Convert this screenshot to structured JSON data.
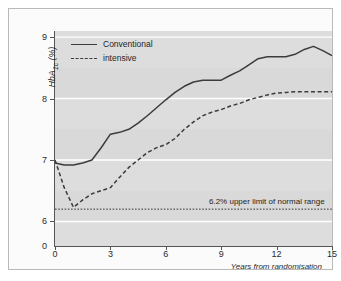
{
  "chart_data": {
    "type": "line",
    "title": "",
    "xlabel": "Years from randomisation",
    "ylabel": "HbA1c (%)",
    "ylabel_html": "HbA<sub>1c</sub> (%)",
    "xlim": [
      0,
      15
    ],
    "ylim": [
      5.6,
      9.1
    ],
    "yticks": [
      6,
      7,
      8,
      9
    ],
    "ytick_labels": [
      "6",
      "7",
      "8",
      "9"
    ],
    "y_origin_label": "0",
    "y_axis_broken": true,
    "xticks": [
      0,
      3,
      6,
      9,
      12,
      15
    ],
    "xtick_labels": [
      "0",
      "3",
      "6",
      "9",
      "12",
      "15"
    ],
    "grid": "horizontal-white",
    "legend_position": "top-left",
    "plot_background": "#d9d9d9",
    "line_color": "#3c3c3c",
    "series": [
      {
        "name": "Conventional",
        "style": "solid",
        "x": [
          0,
          0.5,
          1,
          1.5,
          2,
          2.5,
          3,
          3.5,
          4,
          4.5,
          5,
          5.5,
          6,
          6.5,
          7,
          7.5,
          8,
          8.5,
          9,
          9.5,
          10,
          10.5,
          11,
          11.5,
          12,
          12.5,
          13,
          13.5,
          14,
          14.5,
          15
        ],
        "y": [
          6.95,
          6.92,
          6.92,
          6.95,
          7.0,
          7.2,
          7.42,
          7.45,
          7.5,
          7.6,
          7.72,
          7.85,
          7.98,
          8.1,
          8.2,
          8.27,
          8.3,
          8.3,
          8.3,
          8.38,
          8.45,
          8.55,
          8.65,
          8.68,
          8.68,
          8.68,
          8.72,
          8.8,
          8.85,
          8.78,
          8.7
        ]
      },
      {
        "name": "intensive",
        "style": "dashed",
        "x": [
          0,
          0.5,
          1,
          1.5,
          2,
          2.5,
          3,
          3.5,
          4,
          4.5,
          5,
          5.5,
          6,
          6.5,
          7,
          7.5,
          8,
          8.5,
          9,
          9.5,
          10,
          10.5,
          11,
          11.5,
          12,
          12.5,
          13,
          13.5,
          14,
          14.5,
          15
        ],
        "y": [
          7.0,
          6.55,
          6.23,
          6.35,
          6.45,
          6.5,
          6.55,
          6.72,
          6.88,
          7.0,
          7.12,
          7.2,
          7.25,
          7.35,
          7.5,
          7.62,
          7.72,
          7.78,
          7.82,
          7.88,
          7.92,
          7.98,
          8.02,
          8.06,
          8.09,
          8.1,
          8.11,
          8.11,
          8.11,
          8.11,
          8.11
        ]
      }
    ],
    "reference_line": {
      "value": 6.2,
      "style": "dotted",
      "label": "6.2% upper limit of normal range",
      "label_x": 14.6
    }
  }
}
